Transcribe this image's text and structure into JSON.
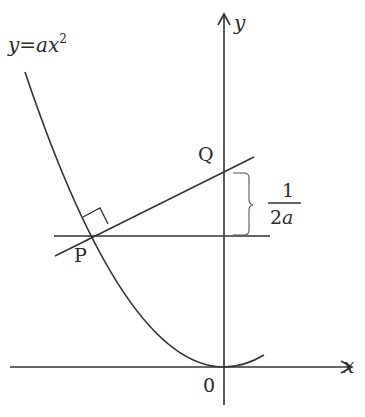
{
  "diagram": {
    "curve_label": {
      "y": "y",
      "eq": "=",
      "a": "a",
      "x": "x",
      "exp": "2"
    },
    "axes": {
      "x_label": "x",
      "y_label": "y",
      "origin_label": "0"
    },
    "points": {
      "P": "P",
      "Q": "Q"
    },
    "distance_label": {
      "numerator": "1",
      "denominator": "2a"
    },
    "colors": {
      "stroke": "#333333",
      "text": "#2a2a2a",
      "brace": "#555555"
    }
  }
}
